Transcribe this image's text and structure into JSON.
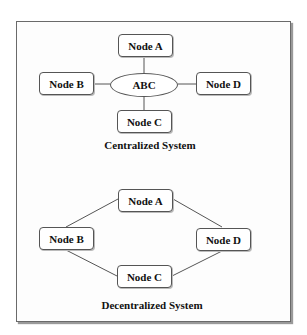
{
  "colors": {
    "line": "#555555",
    "frame": "#6a6a6a",
    "text": "#111111"
  },
  "centralized": {
    "caption": "Centralized System",
    "hub": {
      "label": "ABC",
      "shape": "ellipse"
    },
    "nodes": [
      {
        "id": "A",
        "label": "Node A"
      },
      {
        "id": "B",
        "label": "Node B"
      },
      {
        "id": "C",
        "label": "Node C"
      },
      {
        "id": "D",
        "label": "Node D"
      }
    ],
    "edges": [
      [
        "ABC",
        "A"
      ],
      [
        "ABC",
        "B"
      ],
      [
        "ABC",
        "C"
      ],
      [
        "ABC",
        "D"
      ]
    ]
  },
  "decentralized": {
    "caption": "Decentralized System",
    "nodes": [
      {
        "id": "A",
        "label": "Node A"
      },
      {
        "id": "B",
        "label": "Node B"
      },
      {
        "id": "C",
        "label": "Node C"
      },
      {
        "id": "D",
        "label": "Node D"
      }
    ],
    "edges": [
      [
        "A",
        "B"
      ],
      [
        "A",
        "D"
      ],
      [
        "B",
        "C"
      ],
      [
        "C",
        "D"
      ]
    ]
  }
}
